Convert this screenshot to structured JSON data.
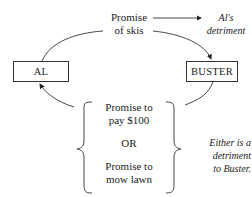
{
  "diagram": {
    "nodes": {
      "al": "AL",
      "buster": "BUSTER"
    },
    "top_promise": {
      "line1": "Promise",
      "line2": "of skis"
    },
    "top_note": {
      "line1": "Al's",
      "line2": "detriment"
    },
    "options": {
      "opt1_line1": "Promise to",
      "opt1_line2": "pay $100",
      "or": "OR",
      "opt2_line1": "Promise to",
      "opt2_line2": "mow lawn"
    },
    "side_note": {
      "line1": "Either is a",
      "line2": "detriment",
      "line3": "to Buster."
    }
  }
}
